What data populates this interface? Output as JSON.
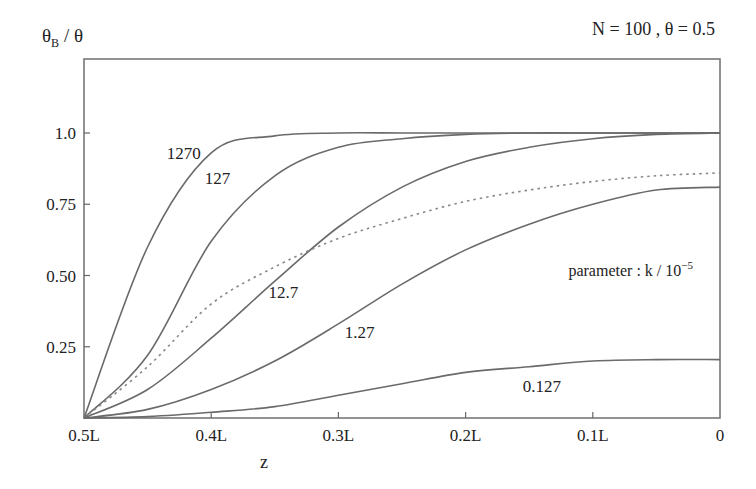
{
  "chart_data": {
    "type": "line",
    "title": "N = 100 , θ = 0.5",
    "ylabel": "θB / θ",
    "ylabel_main": "θ",
    "ylabel_sub": "B",
    "ylabel_rest": " / θ",
    "xlabel": "z",
    "xlim": [
      0.5,
      0
    ],
    "ylim": [
      0,
      1.1
    ],
    "grid": false,
    "x_ticks": [
      {
        "value": 0.5,
        "label": "0.5L"
      },
      {
        "value": 0.4,
        "label": "0.4L"
      },
      {
        "value": 0.3,
        "label": "0.3L"
      },
      {
        "value": 0.2,
        "label": "0.2L"
      },
      {
        "value": 0.1,
        "label": "0.1L"
      },
      {
        "value": 0.0,
        "label": "0"
      }
    ],
    "y_ticks": [
      {
        "value": 1.0,
        "label": "1.0"
      },
      {
        "value": 0.75,
        "label": "0.75"
      },
      {
        "value": 0.5,
        "label": "0.50"
      },
      {
        "value": 0.25,
        "label": "0.25"
      }
    ],
    "annotation": "parameter : k / 10",
    "annotation_exp": "−5",
    "x": [
      0.5,
      0.45,
      0.4,
      0.35,
      0.3,
      0.25,
      0.2,
      0.15,
      0.1,
      0.05,
      0.0
    ],
    "series": [
      {
        "name": "1270",
        "style": "solid",
        "label_pos": [
          0.435,
          0.91
        ],
        "values": [
          0,
          0.6,
          0.93,
          0.99,
          1.0,
          1.0,
          1.0,
          1.0,
          1.0,
          1.0,
          1.0
        ]
      },
      {
        "name": "127",
        "style": "solid",
        "label_pos": [
          0.405,
          0.82
        ],
        "values": [
          0,
          0.22,
          0.62,
          0.85,
          0.95,
          0.98,
          0.995,
          1.0,
          1.0,
          1.0,
          1.0
        ]
      },
      {
        "name": "12.7",
        "style": "solid",
        "label_pos": [
          0.355,
          0.42
        ],
        "values": [
          0,
          0.1,
          0.28,
          0.48,
          0.67,
          0.81,
          0.9,
          0.95,
          0.98,
          0.995,
          1.0
        ]
      },
      {
        "name": "dotted",
        "style": "dotted",
        "label_pos": null,
        "values": [
          0,
          0.18,
          0.4,
          0.53,
          0.63,
          0.7,
          0.76,
          0.8,
          0.83,
          0.85,
          0.86
        ]
      },
      {
        "name": "1.27",
        "style": "solid",
        "label_pos": [
          0.295,
          0.28
        ],
        "values": [
          0,
          0.03,
          0.1,
          0.2,
          0.33,
          0.47,
          0.59,
          0.68,
          0.75,
          0.8,
          0.81
        ]
      },
      {
        "name": "0.127",
        "style": "solid",
        "label_pos": [
          0.155,
          0.09
        ],
        "values": [
          0,
          0.005,
          0.02,
          0.04,
          0.08,
          0.12,
          0.16,
          0.18,
          0.2,
          0.205,
          0.205
        ]
      }
    ]
  }
}
